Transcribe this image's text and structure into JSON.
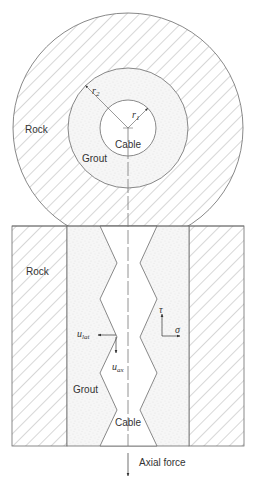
{
  "figure": {
    "cross_section": {
      "rock_label": "Rock",
      "grout_label": "Grout",
      "cable_label": "Cable",
      "r1_label": "r",
      "r1_sub": "1",
      "r2_label": "r",
      "r2_sub": "2"
    },
    "longitudinal_section": {
      "rock_label": "Rock",
      "grout_label": "Grout",
      "cable_label": "Cable",
      "tau_label": "τ",
      "sigma_label": "σ",
      "ulat_label": "u",
      "ulat_sub": "lat",
      "uax_label": "u",
      "uax_sub": "ax",
      "axial_force_label": "Axial force"
    },
    "colors": {
      "line": "#6b6b6b",
      "hatch": "#9a9a9a",
      "grout_fill": "#f4f4f4",
      "text": "#333333"
    }
  }
}
